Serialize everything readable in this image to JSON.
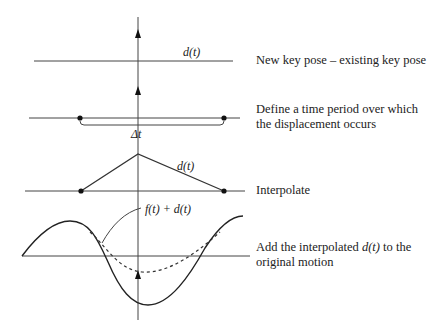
{
  "labels": {
    "top_d": "d(t)",
    "delta_t": "Δt",
    "triangle_d": "d(t)",
    "sum": "f(t) + d(t)"
  },
  "steps": [
    {
      "text": "New key pose – existing key pose"
    },
    {
      "text": "Define a time period over which the displacement occurs"
    },
    {
      "text": "Interpolate"
    },
    {
      "text_prefix": "Add the interpolated ",
      "text_math": "d(t)",
      "text_suffix": " to the original motion"
    }
  ],
  "colors": {
    "stroke": "#333333",
    "axis": "#555555",
    "background": "#ffffff"
  }
}
